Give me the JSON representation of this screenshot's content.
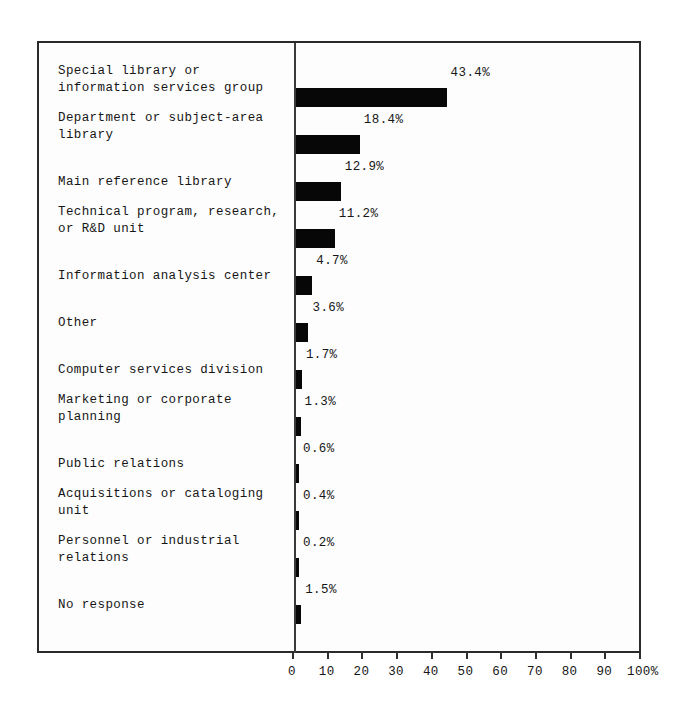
{
  "chart_data": {
    "type": "bar",
    "orientation": "horizontal",
    "title": "",
    "subtitle": "",
    "xlabel": "",
    "ylabel": "",
    "xlim": [
      0,
      100
    ],
    "x_unit": "%",
    "grid": false,
    "legend": null,
    "value_label_suffix": "%",
    "xticks": [
      0,
      10,
      20,
      30,
      40,
      50,
      60,
      70,
      80,
      90,
      100
    ],
    "xtick_labels": [
      "0",
      "10",
      "20",
      "30",
      "40",
      "50",
      "60",
      "70",
      "80",
      "90",
      "100%"
    ],
    "categories": [
      "Special library or\ninformation services group",
      "Department or subject-area\nlibrary",
      "Main reference library",
      "Technical program, research,\nor R&D unit",
      "Information analysis center",
      "Other",
      "Computer services division",
      "Marketing or corporate\nplanning",
      "Public relations",
      "Acquisitions or cataloging\nunit",
      "Personnel or industrial\nrelations",
      "No response"
    ],
    "values": [
      43.4,
      18.4,
      12.9,
      11.2,
      4.7,
      3.6,
      1.7,
      1.3,
      0.6,
      0.4,
      0.2,
      1.5
    ],
    "value_labels": [
      "43.4%",
      "18.4%",
      "12.9%",
      "11.2%",
      "4.7%",
      "3.6%",
      "1.7%",
      "1.3%",
      "0.6%",
      "0.4%",
      "0.2%",
      "1.5%"
    ],
    "bar_color": "#070707",
    "frame_color": "#2a2a2a",
    "background_color": "#fdfdfd"
  }
}
